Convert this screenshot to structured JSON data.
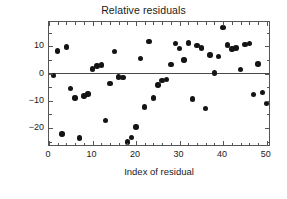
{
  "chart_data": {
    "type": "scatter",
    "title": "Relative residuals",
    "xlabel": "Index of residual",
    "ylabel": "(y − f(x))/y ∗ 100",
    "xlim": [
      0,
      51
    ],
    "ylim": [
      -27,
      19
    ],
    "grid": false,
    "legend": null,
    "marker": "filled-circle",
    "marker_color": "#141414",
    "reference_line": {
      "orientation": "horizontal",
      "y": 0,
      "color": "#4a4a4a"
    },
    "xticks": [
      0,
      10,
      20,
      30,
      40,
      50
    ],
    "xticklabels": [
      "0",
      "10",
      "20",
      "30",
      "40",
      "50"
    ],
    "yticks": [
      10,
      0,
      -10,
      -20
    ],
    "yticklabels": [
      "10",
      "0",
      "−10",
      "−20"
    ],
    "x": [
      1,
      2,
      3,
      4,
      5,
      6,
      7,
      8,
      9,
      10,
      11,
      12,
      13,
      14,
      15,
      16,
      17,
      18,
      19,
      20,
      21,
      22,
      23,
      24,
      25,
      26,
      27,
      28,
      29,
      30,
      31,
      32,
      33,
      34,
      35,
      36,
      37,
      38,
      39,
      40,
      41,
      42,
      43,
      44,
      45,
      46,
      47,
      48,
      49,
      50
    ],
    "y": [
      -0.7,
      8.4,
      -22.2,
      9.8,
      -5.5,
      -9.0,
      -23.7,
      -8.2,
      -7.5,
      1.7,
      2.8,
      3.2,
      -17.3,
      -3.6,
      8.1,
      -1.2,
      -1.4,
      -25.2,
      -23.4,
      -19.7,
      5.5,
      -12.3,
      11.9,
      -8.9,
      -4.2,
      -2.6,
      -2.2,
      3.4,
      11.0,
      9.2,
      5.0,
      11.3,
      -9.3,
      10.3,
      9.5,
      -12.8,
      6.9,
      0.2,
      6.2,
      16.9,
      10.6,
      9.0,
      9.4,
      1.6,
      10.8,
      11.1,
      -7.7,
      3.6,
      -6.9,
      -11.1
    ]
  }
}
